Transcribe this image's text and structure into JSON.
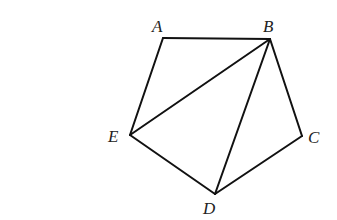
{
  "figure": {
    "type": "pentagon with diagonals",
    "vertices": [
      {
        "id": "A",
        "label": "A",
        "x": 163,
        "y": 38,
        "label_x": 152,
        "label_y": 32
      },
      {
        "id": "B",
        "label": "B",
        "x": 270,
        "y": 39,
        "label_x": 263,
        "label_y": 32
      },
      {
        "id": "C",
        "label": "C",
        "x": 302,
        "y": 136,
        "label_x": 308,
        "label_y": 143
      },
      {
        "id": "D",
        "label": "D",
        "x": 215,
        "y": 194,
        "label_x": 203,
        "label_y": 214
      },
      {
        "id": "E",
        "label": "E",
        "x": 130,
        "y": 135,
        "label_x": 108,
        "label_y": 142
      }
    ],
    "edges": [
      {
        "from": "A",
        "to": "B",
        "kind": "side"
      },
      {
        "from": "B",
        "to": "C",
        "kind": "side"
      },
      {
        "from": "C",
        "to": "D",
        "kind": "side"
      },
      {
        "from": "D",
        "to": "E",
        "kind": "side"
      },
      {
        "from": "E",
        "to": "A",
        "kind": "side"
      },
      {
        "from": "B",
        "to": "E",
        "kind": "diagonal"
      },
      {
        "from": "B",
        "to": "D",
        "kind": "diagonal"
      }
    ],
    "stroke_color": "#111111",
    "label_color": "#222222"
  }
}
